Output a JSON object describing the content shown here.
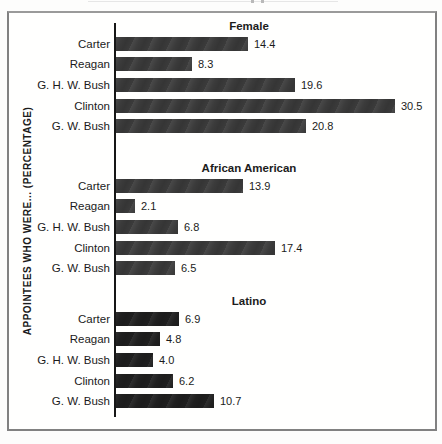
{
  "figure": {
    "ylabel": "APPOINTEES WHO WERE... (PERCENTAGE)",
    "frame_border_color": "#818181",
    "axis_color": "#171717"
  },
  "chart_data": {
    "type": "bar",
    "orientation": "horizontal",
    "title": "",
    "xlabel": "",
    "ylabel": "APPOINTEES WHO WERE... (PERCENTAGE)",
    "grid": false,
    "xlim": [
      0,
      35
    ],
    "value_labels_shown": true,
    "categories": [
      "Carter",
      "Reagan",
      "G. H. W. Bush",
      "Clinton",
      "G. W. Bush"
    ],
    "groups": [
      {
        "title": "Female",
        "values": [
          14.4,
          8.3,
          19.6,
          30.5,
          20.8
        ],
        "display": [
          "14.4",
          "8.3",
          "19.6",
          "30.5",
          "20.8"
        ],
        "bar_color": "#3b3b3b"
      },
      {
        "title": "African American",
        "values": [
          13.9,
          2.1,
          6.8,
          17.4,
          6.5
        ],
        "display": [
          "13.9",
          "2.1",
          "6.8",
          "17.4",
          "6.5"
        ],
        "bar_color": "#3b3b3b"
      },
      {
        "title": "Latino",
        "values": [
          6.9,
          4.8,
          4.0,
          6.2,
          10.7
        ],
        "display": [
          "6.9",
          "4.8",
          "4.0",
          "6.2",
          "10.7"
        ],
        "bar_color": "#1f1f1f"
      }
    ]
  }
}
